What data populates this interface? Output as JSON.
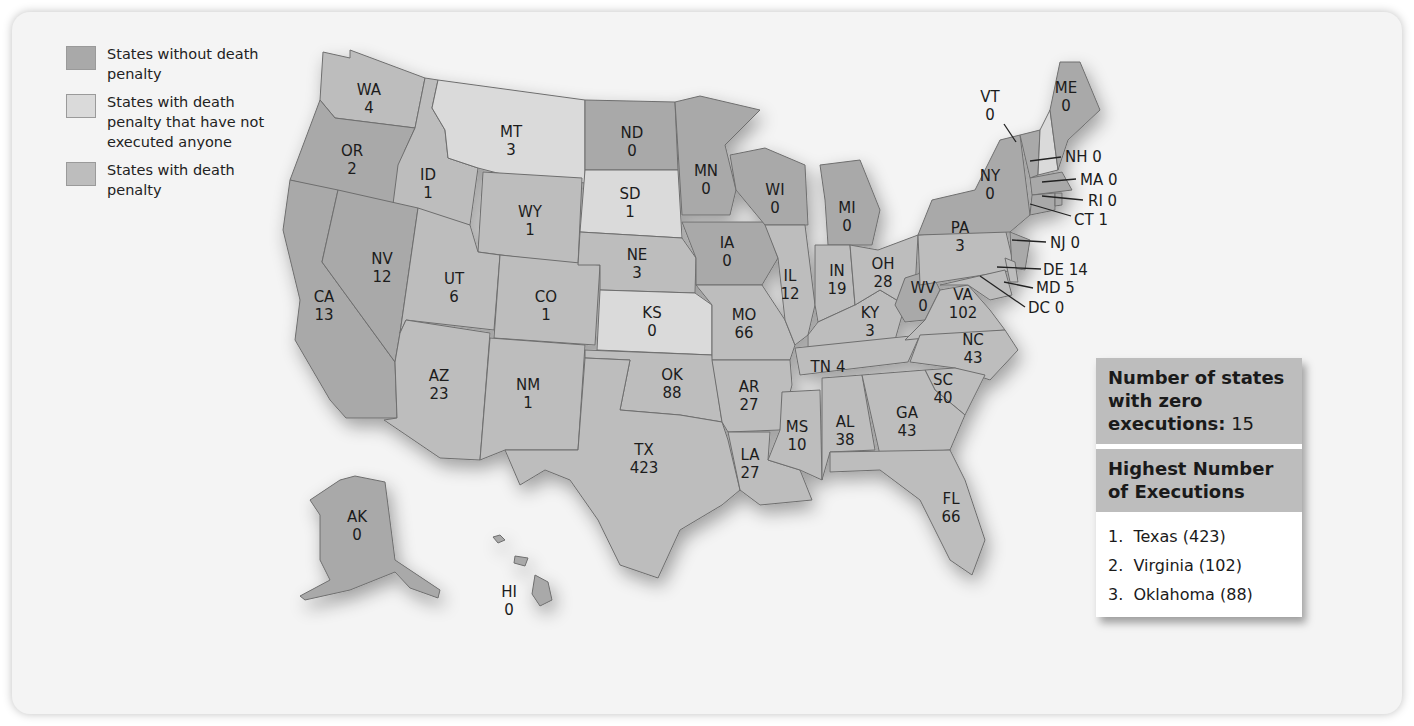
{
  "colors": {
    "no_penalty": "#a9a9a9",
    "penalty_no_exec": "#dadada",
    "penalty": "#bdbdbd",
    "background": "#f4f4f4"
  },
  "legend": {
    "items": [
      {
        "label": "States without death penalty",
        "category": "no_penalty"
      },
      {
        "label": "States with death penalty that have not executed anyone",
        "category": "penalty_no_exec"
      },
      {
        "label": "States with death penalty",
        "category": "penalty"
      }
    ]
  },
  "summary": {
    "zero_label": "Number of states with zero executions:",
    "zero_value": "15",
    "highest_title": "Highest Number of Executions",
    "highest": [
      {
        "rank": "1.",
        "text": "Texas (423)"
      },
      {
        "rank": "2.",
        "text": "Virginia (102)"
      },
      {
        "rank": "3.",
        "text": "Oklahoma (88)"
      }
    ]
  },
  "states": [
    {
      "abbr": "WA",
      "value": "4"
    },
    {
      "abbr": "OR",
      "value": "2"
    },
    {
      "abbr": "CA",
      "value": "13"
    },
    {
      "abbr": "ID",
      "value": "1"
    },
    {
      "abbr": "NV",
      "value": "12"
    },
    {
      "abbr": "MT",
      "value": "3"
    },
    {
      "abbr": "WY",
      "value": "1"
    },
    {
      "abbr": "UT",
      "value": "6"
    },
    {
      "abbr": "AZ",
      "value": "23"
    },
    {
      "abbr": "CO",
      "value": "1"
    },
    {
      "abbr": "NM",
      "value": "1"
    },
    {
      "abbr": "ND",
      "value": "0"
    },
    {
      "abbr": "SD",
      "value": "1"
    },
    {
      "abbr": "NE",
      "value": "3"
    },
    {
      "abbr": "KS",
      "value": "0"
    },
    {
      "abbr": "OK",
      "value": "88"
    },
    {
      "abbr": "TX",
      "value": "423"
    },
    {
      "abbr": "MN",
      "value": "0"
    },
    {
      "abbr": "IA",
      "value": "0"
    },
    {
      "abbr": "MO",
      "value": "66"
    },
    {
      "abbr": "AR",
      "value": "27"
    },
    {
      "abbr": "LA",
      "value": "27"
    },
    {
      "abbr": "WI",
      "value": "0"
    },
    {
      "abbr": "IL",
      "value": "12"
    },
    {
      "abbr": "MS",
      "value": "10"
    },
    {
      "abbr": "MI",
      "value": "0"
    },
    {
      "abbr": "IN",
      "value": "19"
    },
    {
      "abbr": "KY",
      "value": "3"
    },
    {
      "abbr": "TN",
      "value": "4"
    },
    {
      "abbr": "AL",
      "value": "38"
    },
    {
      "abbr": "OH",
      "value": "28"
    },
    {
      "abbr": "WV",
      "value": "0"
    },
    {
      "abbr": "VA",
      "value": "102"
    },
    {
      "abbr": "NC",
      "value": "43"
    },
    {
      "abbr": "SC",
      "value": "40"
    },
    {
      "abbr": "GA",
      "value": "43"
    },
    {
      "abbr": "FL",
      "value": "66"
    },
    {
      "abbr": "PA",
      "value": "3"
    },
    {
      "abbr": "NY",
      "value": "0"
    },
    {
      "abbr": "VT",
      "value": "0"
    },
    {
      "abbr": "ME",
      "value": "0"
    },
    {
      "abbr": "AK",
      "value": "0"
    },
    {
      "abbr": "HI",
      "value": "0"
    }
  ],
  "callouts": [
    {
      "text": "NH 0"
    },
    {
      "text": "MA 0"
    },
    {
      "text": "RI 0"
    },
    {
      "text": "CT 1"
    },
    {
      "text": "NJ 0"
    },
    {
      "text": "DE 14"
    },
    {
      "text": "MD 5"
    },
    {
      "text": "DC 0"
    }
  ]
}
